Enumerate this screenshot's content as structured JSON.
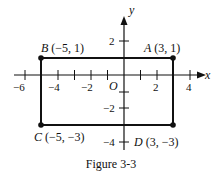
{
  "figure": {
    "caption": "Figure 3-3",
    "axes": {
      "x_label": "x",
      "y_label": "y",
      "origin_label": "O",
      "x_ticks": [
        {
          "value": -6,
          "label": "−6"
        },
        {
          "value": -4,
          "label": "−4"
        },
        {
          "value": -2,
          "label": "−2"
        },
        {
          "value": 2,
          "label": "2"
        },
        {
          "value": 4,
          "label": "4"
        }
      ],
      "y_ticks": [
        {
          "value": 2,
          "label": "2"
        },
        {
          "value": -2,
          "label": "−2"
        },
        {
          "value": -4,
          "label": "−4"
        }
      ]
    },
    "points": [
      {
        "name": "A",
        "coords": "(3, 1)",
        "x": 3,
        "y": 1
      },
      {
        "name": "B",
        "coords": "(−5, 1)",
        "x": -5,
        "y": 1
      },
      {
        "name": "C",
        "coords": "(−5, −3)",
        "x": -5,
        "y": -3
      },
      {
        "name": "D",
        "coords": "(3, −3)",
        "x": 3,
        "y": -3
      }
    ],
    "shape": "rectangle ABDC",
    "colors": {
      "ink": "#111111",
      "background": "#ffffff"
    }
  }
}
